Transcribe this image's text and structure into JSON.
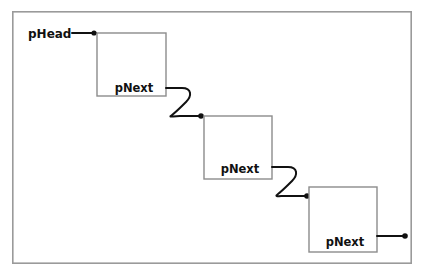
{
  "diagram": {
    "type": "linked-list",
    "frame": {
      "x": 12,
      "y": 11,
      "width": 400,
      "height": 253
    },
    "colors": {
      "background": "#ffffff",
      "frame_stroke": "#9a9a9a",
      "node_stroke": "#8c8c8c",
      "node_fill": "#ffffff",
      "link_stroke": "#111111",
      "text": "#111111"
    },
    "head_pointer": {
      "label": "pHead",
      "label_x": 28,
      "label_y": 38,
      "line_start_x": 72,
      "line_end_x": 97,
      "line_y": 33,
      "dot_x": 94,
      "dot_y": 33,
      "dot_r": 2.6
    },
    "nodes": [
      {
        "id": "node-1",
        "label": "pNext",
        "x": 97,
        "y": 33,
        "width": 69,
        "height": 63,
        "label_x": 134,
        "label_y": 92
      },
      {
        "id": "node-2",
        "label": "pNext",
        "x": 204,
        "y": 116,
        "width": 68,
        "height": 63,
        "label_x": 240,
        "label_y": 173
      },
      {
        "id": "node-3",
        "label": "pNext",
        "x": 309,
        "y": 187,
        "width": 68,
        "height": 65,
        "label_x": 345,
        "label_y": 246
      }
    ],
    "links": [
      {
        "id": "link-1-to-2",
        "from": "node-1",
        "to": "node-2",
        "path": "M 166 88 L 182 88 C 192 88 192 96 186 102 C 178 110 176 112 172 115 C 168 118 172 116 180 116 L 200 116",
        "dot_x": 201,
        "dot_y": 116,
        "dot_r": 2.8
      },
      {
        "id": "link-2-to-3",
        "from": "node-2",
        "to": "node-3",
        "path": "M 272 167 L 288 167 C 298 167 298 175 292 181 C 284 189 282 191 278 194 C 274 197 278 196 286 196 L 306 196",
        "dot_x": 307,
        "dot_y": 196,
        "dot_r": 2.8
      },
      {
        "id": "link-3-to-null",
        "from": "node-3",
        "to": "terminator",
        "path": "M 377 236 L 404 236",
        "dot_x": 405,
        "dot_y": 236,
        "dot_r": 2.8
      }
    ]
  }
}
